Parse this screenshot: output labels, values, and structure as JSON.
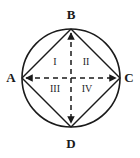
{
  "figure": {
    "type": "geometry-diagram",
    "stroke_color": "#1a1a1a",
    "background_color": "#ffffff",
    "circle": {
      "center_x": 71,
      "center_y": 78,
      "radius": 49
    },
    "vertices": [
      {
        "id": "A",
        "label": "A",
        "x": 22,
        "y": 78
      },
      {
        "id": "B",
        "label": "B",
        "x": 71,
        "y": 29
      },
      {
        "id": "C",
        "label": "C",
        "x": 120,
        "y": 78
      },
      {
        "id": "D",
        "label": "D",
        "x": 71,
        "y": 127
      }
    ],
    "chords": [
      {
        "from": "A",
        "to": "B"
      },
      {
        "from": "B",
        "to": "C"
      },
      {
        "from": "C",
        "to": "D"
      },
      {
        "from": "D",
        "to": "A"
      }
    ],
    "diagonals": [
      {
        "from": "A",
        "to": "C",
        "style": "dashed",
        "arrows": "both"
      },
      {
        "from": "B",
        "to": "D",
        "style": "dashed",
        "arrows": "both"
      }
    ],
    "regions": [
      {
        "id": "I",
        "label": "I",
        "position": "upper-left",
        "x": 55,
        "y": 62
      },
      {
        "id": "II",
        "label": "II",
        "position": "upper-right",
        "x": 86,
        "y": 62
      },
      {
        "id": "III",
        "label": "III",
        "position": "lower-left",
        "x": 55,
        "y": 89
      },
      {
        "id": "IV",
        "label": "IV",
        "position": "lower-right",
        "x": 87,
        "y": 89
      }
    ]
  }
}
